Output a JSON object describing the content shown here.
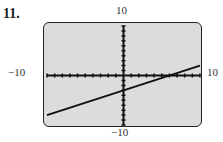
{
  "problem_number": "11.",
  "window": {
    "xmin": -10,
    "xmax": 10,
    "ymin": -10,
    "ymax": 10,
    "xscl": 1,
    "yscl": 1
  },
  "labels": {
    "ymax": "10",
    "ymin": "−10",
    "xmin": "−10",
    "xmax": "10"
  },
  "chart_data": {
    "type": "line",
    "title": "",
    "xlabel": "",
    "ylabel": "",
    "xlim": [
      -10,
      10
    ],
    "ylim": [
      -10,
      10
    ],
    "grid": false,
    "series": [
      {
        "name": "y = 0.5x - 3",
        "x": [
          -10,
          10
        ],
        "y": [
          -8,
          2
        ]
      }
    ],
    "x_intercept": 6,
    "y_intercept": -3,
    "tick_labels": {
      "x": [
        "-10",
        "10"
      ],
      "y": [
        "-10",
        "10"
      ]
    }
  }
}
